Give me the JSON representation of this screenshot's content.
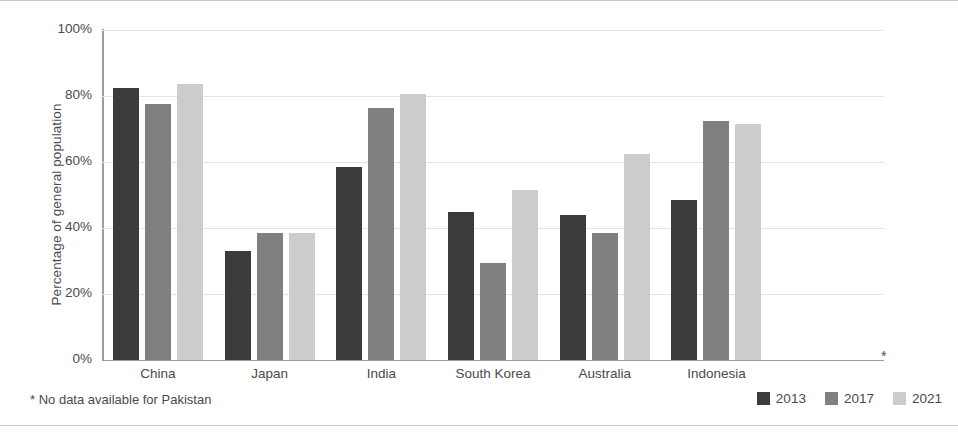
{
  "chart_data": {
    "type": "bar",
    "title": "",
    "xlabel": "",
    "ylabel": "Percentage of general population",
    "ylim": [
      0,
      100
    ],
    "grid": true,
    "legend_position": "bottom-right",
    "categories": [
      "China",
      "Japan",
      "India",
      "South Korea",
      "Australia",
      "Indonesia"
    ],
    "ytick_labels": [
      "100%",
      "80%",
      "60%",
      "40%",
      "20%",
      "0%"
    ],
    "ytick_values": [
      100,
      80,
      60,
      40,
      20,
      0
    ],
    "series": [
      {
        "name": "2013",
        "color": "#3b3b3b",
        "values": [
          82.5,
          33.0,
          58.5,
          45.0,
          44.0,
          48.5
        ]
      },
      {
        "name": "2017",
        "color": "#808080",
        "values": [
          77.5,
          38.5,
          76.5,
          29.5,
          38.5,
          72.5
        ]
      },
      {
        "name": "2021",
        "color": "#cccccc",
        "values": [
          83.5,
          38.5,
          80.5,
          51.5,
          62.5,
          71.5
        ]
      }
    ],
    "annotations": {
      "missing_marker": "*",
      "footnote": "* No data available for Pakistan"
    }
  },
  "axis": {
    "y_title": "Percentage of general population"
  },
  "legend": {
    "items": [
      {
        "label": "2013",
        "color": "#3b3b3b"
      },
      {
        "label": "2017",
        "color": "#808080"
      },
      {
        "label": "2021",
        "color": "#cccccc"
      }
    ]
  },
  "footnote": {
    "text": "* No data available for Pakistan"
  }
}
